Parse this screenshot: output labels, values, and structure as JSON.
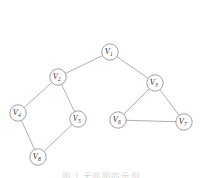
{
  "figure": {
    "kind": "undirected-graph-diagram",
    "background_color": "#ffffff",
    "width": 202,
    "height": 178,
    "node_stroke_color": "#8f8f8f",
    "edge_stroke_color": "#9a9a9a",
    "label_color": "#2e2e2e",
    "node_radius": 8.2
  },
  "caption": {
    "text": "图 1    无向图的示例",
    "visible": "partially-cut-off-at-bottom-edge"
  },
  "graph": {
    "nodes": [
      {
        "id": "V1",
        "base": "V",
        "sub": "1",
        "x": 110,
        "y": 52
      },
      {
        "id": "V2",
        "base": "V",
        "sub": "2",
        "x": 58,
        "y": 77
      },
      {
        "id": "V3",
        "base": "V",
        "sub": "3",
        "x": 155,
        "y": 83
      },
      {
        "id": "V4",
        "base": "V",
        "sub": "4",
        "x": 18,
        "y": 113
      },
      {
        "id": "V5",
        "base": "V",
        "sub": "5",
        "x": 78,
        "y": 119
      },
      {
        "id": "V6",
        "base": "V",
        "sub": "6",
        "x": 118,
        "y": 120
      },
      {
        "id": "V7",
        "base": "V",
        "sub": "7",
        "x": 184,
        "y": 122
      },
      {
        "id": "V8",
        "base": "V",
        "sub": "8",
        "x": 38,
        "y": 157
      }
    ],
    "edges": [
      {
        "from": "V1",
        "to": "V2"
      },
      {
        "from": "V1",
        "to": "V3"
      },
      {
        "from": "V2",
        "to": "V4"
      },
      {
        "from": "V2",
        "to": "V5"
      },
      {
        "from": "V4",
        "to": "V8"
      },
      {
        "from": "V5",
        "to": "V8"
      },
      {
        "from": "V3",
        "to": "V6"
      },
      {
        "from": "V3",
        "to": "V7"
      },
      {
        "from": "V6",
        "to": "V7"
      }
    ]
  }
}
